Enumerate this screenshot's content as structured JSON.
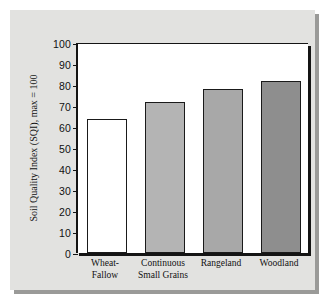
{
  "chart_data": {
    "type": "bar",
    "title": "",
    "xlabel": "",
    "ylabel": "Soil Quality Index (SQI), max = 100",
    "categories": [
      "Wheat-Fallow",
      "Continuous Small Grains",
      "Rangeland",
      "Woodland"
    ],
    "category_lines": [
      [
        "Wheat-",
        "Fallow"
      ],
      [
        "Continuous",
        "Small Grains"
      ],
      [
        "Rangeland",
        ""
      ],
      [
        "Woodland",
        ""
      ]
    ],
    "values": [
      64,
      72,
      78,
      82
    ],
    "ylim": [
      0,
      100
    ],
    "ytick_labels": [
      "100",
      "90",
      "80",
      "70",
      "60",
      "50",
      "40",
      "30",
      "20",
      "10",
      "0"
    ],
    "ytick_values": [
      100,
      90,
      80,
      70,
      60,
      50,
      40,
      30,
      20,
      10,
      0
    ],
    "grid": false,
    "legend": "none",
    "bar_colors": [
      "#ffffff",
      "#b4b4b4",
      "#a8a8a8",
      "#8e8e8e"
    ],
    "bar_outline_color": "#1a1a1a",
    "plot_background": "#ffffff",
    "page_background": "#e2e2e0",
    "axis_color": "#141414"
  }
}
